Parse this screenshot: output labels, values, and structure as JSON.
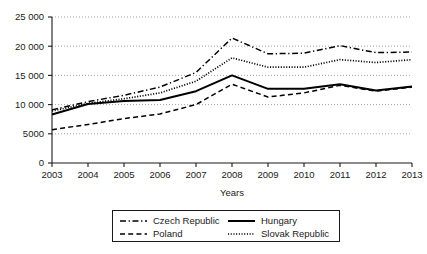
{
  "chart_data": {
    "type": "line",
    "title": "",
    "xlabel": "Years",
    "ylabel": "",
    "categories": [
      "2003",
      "2004",
      "2005",
      "2006",
      "2007",
      "2008",
      "2009",
      "2010",
      "2011",
      "2012",
      "2013"
    ],
    "x": [
      2003,
      2004,
      2005,
      2006,
      2007,
      2008,
      2009,
      2010,
      2011,
      2012,
      2013
    ],
    "xlim": [
      2003,
      2013
    ],
    "ylim": [
      0,
      25000
    ],
    "yticks": [
      0,
      5000,
      10000,
      15000,
      20000,
      25000
    ],
    "ytick_labels": [
      "0",
      "5000",
      "10 000",
      "15 000",
      "20 000",
      "25 000"
    ],
    "xtick_labels": [
      "2003",
      "2004",
      "2005",
      "2006",
      "2007",
      "2008",
      "2009",
      "2010",
      "2011",
      "2012",
      "2013"
    ],
    "grid": "horizontal-dotted",
    "legend_position": "below",
    "series": [
      {
        "name": "Czech Republic",
        "style": "dash-dot",
        "color": "#000000",
        "values": [
          9100,
          10500,
          11600,
          13000,
          15500,
          21400,
          18700,
          18800,
          20100,
          18900,
          19000
        ]
      },
      {
        "name": "Hungary",
        "style": "solid",
        "color": "#000000",
        "values": [
          8300,
          10100,
          10600,
          10800,
          12300,
          15000,
          12700,
          12700,
          13500,
          12400,
          13100
        ]
      },
      {
        "name": "Poland",
        "style": "dashed",
        "color": "#000000",
        "values": [
          5700,
          6600,
          7600,
          8400,
          10000,
          13500,
          11300,
          12000,
          13300,
          12300,
          13000
        ]
      },
      {
        "name": "Slovak Republic",
        "style": "dotted",
        "color": "#000000",
        "values": [
          8900,
          10200,
          11000,
          12000,
          14000,
          18000,
          16400,
          16400,
          17700,
          17200,
          17700
        ]
      }
    ]
  },
  "legend": {
    "entries": [
      {
        "label": "Czech Republic",
        "style": "dash-dot"
      },
      {
        "label": "Hungary",
        "style": "solid"
      },
      {
        "label": "Poland",
        "style": "dashed"
      },
      {
        "label": "Slovak Republic",
        "style": "dotted"
      }
    ]
  },
  "axes": {
    "x_title": "Years"
  }
}
